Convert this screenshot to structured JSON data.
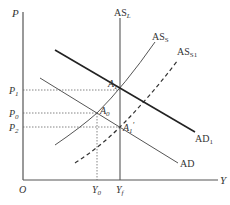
{
  "diagram": {
    "type": "AD-AS model",
    "axes": {
      "y_label": "P",
      "x_label": "Y",
      "origin_label": "O"
    },
    "price_levels": [
      {
        "label": "P",
        "sub": "1",
        "y": 90
      },
      {
        "label": "P",
        "sub": "0",
        "y": 113
      },
      {
        "label": "P",
        "sub": "2",
        "y": 127
      }
    ],
    "output_levels": [
      {
        "label": "Y",
        "sub": "0",
        "x": 97
      },
      {
        "label": "Y",
        "sub": "f",
        "x": 120
      }
    ],
    "curves": {
      "as_long_run": {
        "label": "AS",
        "sub": "L",
        "style": "solid"
      },
      "as_short_run": {
        "label": "AS",
        "sub": "S",
        "style": "solid"
      },
      "as_short_run_shifted": {
        "label": "AS",
        "sub": "S1",
        "style": "dashed"
      },
      "ad": {
        "label": "AD",
        "sub": "",
        "style": "solid"
      },
      "ad_shifted": {
        "label": "AD",
        "sub": "1",
        "style": "solid-bold"
      }
    },
    "points": {
      "a1": {
        "label": "A",
        "sub": "1",
        "prime": ""
      },
      "a0": {
        "label": "A",
        "sub": "0",
        "prime": ""
      },
      "a1_prime": {
        "label": "A",
        "sub": "1",
        "prime": "'"
      }
    },
    "colors": {
      "line": "#444444",
      "bold_line": "#222222",
      "guide": "#666666"
    }
  }
}
